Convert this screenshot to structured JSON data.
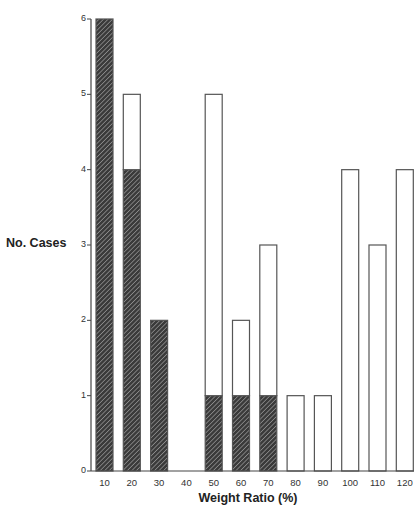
{
  "chart_data": {
    "type": "bar",
    "stacked": true,
    "title": "",
    "xlabel": "Weight Ratio (%)",
    "ylabel": "No. Cases",
    "ylim": [
      0,
      6
    ],
    "yticks": [
      "0",
      "1",
      "2",
      "3",
      "4",
      "5",
      "6"
    ],
    "categories": [
      "10",
      "20",
      "30",
      "40",
      "50",
      "60",
      "70",
      "80",
      "90",
      "100",
      "110",
      "120"
    ],
    "series": [
      {
        "name": "hatched",
        "pattern": "diagonal-hatch",
        "color": "#333333",
        "values": [
          6,
          4,
          2,
          0,
          1,
          1,
          1,
          0,
          0,
          0,
          0,
          0
        ]
      },
      {
        "name": "open",
        "pattern": "none",
        "color": "#ffffff",
        "values": [
          0,
          1,
          0,
          0,
          4,
          1,
          2,
          1,
          1,
          4,
          3,
          4
        ]
      }
    ],
    "totals": [
      6,
      5,
      2,
      0,
      5,
      2,
      3,
      1,
      1,
      4,
      3,
      4
    ],
    "grid": false,
    "legend": null
  },
  "axes": {
    "ylabel": "No. Cases",
    "xlabel": "Weight Ratio (%)"
  }
}
